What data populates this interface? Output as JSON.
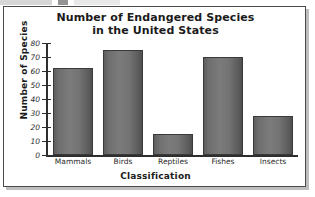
{
  "chart_data": {
    "type": "bar",
    "title": "Number of Endangered Species in the United States",
    "title_line1": "Number of Endangered Species",
    "title_line2": "in the United States",
    "xlabel": "Classification",
    "ylabel": "Number of Species",
    "categories": [
      "Mammals",
      "Birds",
      "Reptiles",
      "Fishes",
      "Insects"
    ],
    "values": [
      62,
      75,
      15,
      70,
      28
    ],
    "ylim": [
      0,
      80
    ],
    "ytick_step": 10,
    "yticks": [
      0,
      10,
      20,
      30,
      40,
      50,
      60,
      70,
      80
    ],
    "ytick_labels": [
      "0",
      "10",
      "20",
      "30",
      "40",
      "50",
      "60",
      "70",
      "80"
    ],
    "grid": false,
    "legend": null,
    "bar_color": "#717171",
    "axis_color": "#2e2e2e",
    "frame_color": "#4a4a4a",
    "background": "#ffffff"
  }
}
